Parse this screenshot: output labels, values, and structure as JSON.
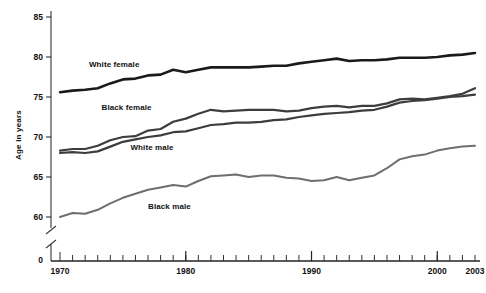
{
  "chart_data": {
    "type": "line",
    "title": "",
    "subtitle": "",
    "xlabel": "",
    "ylabel": "Age in years",
    "xlim": [
      1970,
      2003
    ],
    "ylim": [
      57.5,
      85
    ],
    "y_axis_break": true,
    "y_break_low_label": "0",
    "grid": false,
    "legend_position": "inline-annotations",
    "y_ticks": [
      60,
      65,
      70,
      75,
      80,
      85
    ],
    "y_tick_labels": [
      "60",
      "65",
      "70",
      "75",
      "80",
      "85"
    ],
    "y_zero_label": "0",
    "x_ticks": [
      1970,
      1971,
      1972,
      1973,
      1974,
      1975,
      1976,
      1977,
      1978,
      1979,
      1980,
      1981,
      1982,
      1983,
      1984,
      1985,
      1986,
      1987,
      1988,
      1989,
      1990,
      1991,
      1992,
      1993,
      1994,
      1995,
      1996,
      1997,
      1998,
      1999,
      2000,
      2001,
      2002,
      2003
    ],
    "x_tick_labels": [
      "1970",
      "1980",
      "1990",
      "2000",
      "2003"
    ],
    "x_tick_label_values": [
      1970,
      1980,
      1990,
      2000,
      2003
    ],
    "x": [
      1970,
      1971,
      1972,
      1973,
      1974,
      1975,
      1976,
      1977,
      1978,
      1979,
      1980,
      1981,
      1982,
      1983,
      1984,
      1985,
      1986,
      1987,
      1988,
      1989,
      1990,
      1991,
      1992,
      1993,
      1994,
      1995,
      1996,
      1997,
      1998,
      1999,
      2000,
      2001,
      2002,
      2003
    ],
    "series": [
      {
        "name": "White female",
        "color": "#1a1a1a",
        "width": 2.6,
        "label_x": 1972.3,
        "label_y": 79.0,
        "values": [
          75.6,
          75.8,
          75.9,
          76.1,
          76.7,
          77.2,
          77.3,
          77.7,
          77.8,
          78.4,
          78.1,
          78.4,
          78.7,
          78.7,
          78.7,
          78.7,
          78.8,
          78.9,
          78.9,
          79.2,
          79.4,
          79.6,
          79.8,
          79.5,
          79.6,
          79.6,
          79.7,
          79.9,
          79.9,
          79.9,
          80.0,
          80.2,
          80.3,
          80.5
        ]
      },
      {
        "name": "Black female",
        "color": "#3d3d3d",
        "width": 2.2,
        "label_x": 1973.3,
        "label_y": 73.6,
        "values": [
          68.3,
          68.5,
          68.5,
          68.9,
          69.6,
          70.0,
          70.1,
          70.8,
          71.0,
          71.9,
          72.3,
          72.9,
          73.4,
          73.2,
          73.3,
          73.4,
          73.4,
          73.4,
          73.2,
          73.3,
          73.6,
          73.8,
          73.9,
          73.7,
          73.9,
          73.9,
          74.2,
          74.7,
          74.8,
          74.7,
          74.9,
          75.1,
          75.4,
          76.1
        ]
      },
      {
        "name": "White male",
        "color": "#3d3d3d",
        "width": 2.2,
        "label_x": 1975.6,
        "label_y": 68.6,
        "values": [
          68.0,
          68.1,
          68.0,
          68.2,
          68.8,
          69.4,
          69.7,
          70.0,
          70.2,
          70.6,
          70.7,
          71.1,
          71.5,
          71.6,
          71.8,
          71.8,
          71.9,
          72.1,
          72.2,
          72.5,
          72.7,
          72.9,
          73.0,
          73.1,
          73.3,
          73.4,
          73.8,
          74.3,
          74.5,
          74.6,
          74.8,
          75.0,
          75.1,
          75.3
        ]
      },
      {
        "name": "Black male",
        "color": "#6e6e6e",
        "width": 2.0,
        "label_x": 1977.0,
        "label_y": 61.3,
        "values": [
          60.0,
          60.5,
          60.4,
          60.9,
          61.7,
          62.4,
          62.9,
          63.4,
          63.7,
          64.0,
          63.8,
          64.5,
          65.1,
          65.2,
          65.3,
          65.0,
          65.2,
          65.2,
          64.9,
          64.8,
          64.5,
          64.6,
          65.0,
          64.6,
          64.9,
          65.2,
          66.1,
          67.2,
          67.6,
          67.8,
          68.3,
          68.6,
          68.8,
          68.9
        ]
      }
    ]
  }
}
